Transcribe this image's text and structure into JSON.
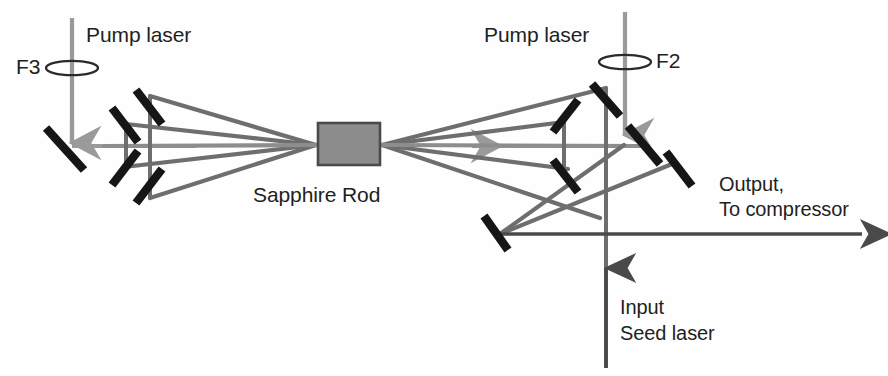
{
  "figure": {
    "type": "optical-layout-diagram",
    "title_text": "",
    "background_color": "#ffffff",
    "beam_color": "#6e6e6e",
    "pump_beam_color": "#9a9a9a",
    "mirror_color": "#1a1a1a",
    "crystal_fill": "#8c8c8c",
    "crystal_stroke": "#4a4a4a",
    "text_color": "#231f20"
  },
  "labels": {
    "pump_left": "Pump laser",
    "pump_right": "Pump laser",
    "lens_left": "F3",
    "lens_right": "F2",
    "crystal": "Sapphire Rod",
    "output_line1": "Output,",
    "output_line2": "To compressor",
    "input_line1": "Input",
    "input_line2": "Seed laser"
  },
  "components": {
    "crystal": {
      "name": "Sapphire Rod",
      "x": 318,
      "y": 123,
      "width": 62,
      "height": 42
    },
    "lenses": [
      {
        "name": "F3",
        "cx": 72,
        "cy": 68,
        "rx": 26,
        "ry": 7
      },
      {
        "name": "F2",
        "cx": 625,
        "cy": 62,
        "rx": 26,
        "ry": 7
      }
    ],
    "mirror_count_left": 5,
    "mirror_count_right": 6,
    "mirror_count_output": 3
  }
}
